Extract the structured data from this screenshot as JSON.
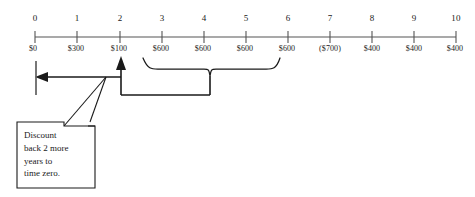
{
  "diagram": {
    "colors": {
      "axis": "#555555",
      "ink": "#1a1a1a",
      "background": "#ffffff"
    },
    "timeline": {
      "periods": [
        "0",
        "1",
        "2",
        "3",
        "4",
        "5",
        "6",
        "7",
        "8",
        "9",
        "10"
      ],
      "amounts": [
        "$0",
        "$300",
        "$100",
        "$600",
        "$600",
        "$600",
        "$600",
        "($700)",
        "$400",
        "$400",
        "$400"
      ],
      "amount_values": [
        0,
        300,
        100,
        600,
        600,
        600,
        600,
        -700,
        400,
        400,
        400
      ]
    },
    "brace": {
      "label": "",
      "from_period": "3",
      "to_period": "6"
    },
    "arrow": {
      "label": "",
      "from_period": "2",
      "to_period": "0",
      "direction": "left"
    },
    "callout": {
      "lines": [
        "Discount",
        "back 2 more",
        "years  to",
        "time zero."
      ]
    }
  }
}
